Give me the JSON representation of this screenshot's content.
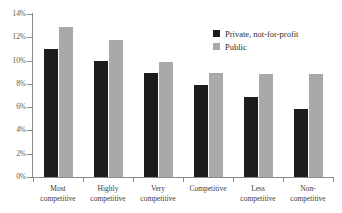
{
  "chart_data": {
    "type": "bar",
    "title": "",
    "subtitle": "",
    "xlabel": "",
    "ylabel": "",
    "ylim": [
      0,
      14
    ],
    "ytick_step": 2,
    "grid": false,
    "legend_position": "top-right",
    "categories": [
      "Most competitive",
      "Highly competitive",
      "Very competitive",
      "Competitive",
      "Less competitive",
      "Non-competitive"
    ],
    "category_lines": [
      [
        "Most",
        "competitive"
      ],
      [
        "Highly",
        "competitive"
      ],
      [
        "Very",
        "competitive"
      ],
      [
        "Competitive"
      ],
      [
        "Less",
        "competitive"
      ],
      [
        "Non-",
        "competitive"
      ]
    ],
    "ytick_labels": [
      "0%",
      "2%",
      "4%",
      "6%",
      "8%",
      "10%",
      "12%",
      "14%"
    ],
    "ytick_values": [
      0,
      2,
      4,
      6,
      8,
      10,
      12,
      14
    ],
    "series": [
      {
        "name": "Private, not-for-profit",
        "color": "#1c1c1c",
        "values": [
          11.0,
          10.0,
          8.9,
          7.9,
          6.9,
          5.8
        ]
      },
      {
        "name": "Public",
        "color": "#a9a9a9",
        "values": [
          12.9,
          11.8,
          9.9,
          8.9,
          8.85,
          8.85
        ]
      }
    ]
  },
  "legend": {
    "items": [
      {
        "label": "Private, not-for-profit",
        "color": "#1c1c1c"
      },
      {
        "label": "Public",
        "color": "#a9a9a9"
      }
    ]
  },
  "axis": {
    "line_color": "#8a8a8a",
    "label_color": "#595959"
  }
}
